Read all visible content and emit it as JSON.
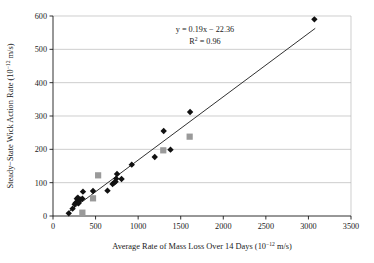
{
  "chart_data": {
    "type": "scatter",
    "title": "",
    "xlabel": "Average Rate of Mass Loss Over 14 Days (10−12 m/s)",
    "xlabel_base": "Average Rate of Mass Loss Over 14 Days (10",
    "xlabel_exp": "−12",
    "xlabel_tail": " m/s)",
    "ylabel": "Steady−State Wick Action Rate (10−12 m/s)",
    "ylabel_base": "Steady−State Wick Action Rate (10",
    "ylabel_exp": "−12",
    "ylabel_tail": " m/s)",
    "xlim": [
      0,
      3500
    ],
    "ylim": [
      0,
      600
    ],
    "xticks": [
      0,
      500,
      1000,
      1500,
      2000,
      2500,
      3000,
      3500
    ],
    "xticklabels": [
      "0",
      "500",
      "1000",
      "1500",
      "2000",
      "2500",
      "3000",
      "3500"
    ],
    "yticks": [
      0,
      100,
      200,
      300,
      400,
      500,
      600
    ],
    "yticklabels": [
      "0",
      "100",
      "200",
      "300",
      "400",
      "500",
      "600"
    ],
    "grid": "horizontal",
    "legend": "none",
    "annotations": {
      "equation": "y = 0.19x − 22.36",
      "r_squared_base": "R",
      "r_squared_exp": "2",
      "r_squared_value": " = 0.96",
      "r_squared": "R2 = 0.96"
    },
    "trendline": {
      "slope": 0.19,
      "intercept": -22.36,
      "r_squared": 0.96,
      "x_start": 170,
      "y_start": 10,
      "x_end": 3080,
      "y_end": 563,
      "color": "#1a1a1a"
    },
    "series": [
      {
        "name": "primary-diamonds",
        "marker": "diamond",
        "color": "#111111",
        "points": [
          [
            185,
            8
          ],
          [
            230,
            22
          ],
          [
            255,
            35
          ],
          [
            268,
            40
          ],
          [
            280,
            52
          ],
          [
            292,
            55
          ],
          [
            300,
            38
          ],
          [
            305,
            45
          ],
          [
            318,
            50
          ],
          [
            345,
            52
          ],
          [
            352,
            73
          ],
          [
            470,
            75
          ],
          [
            640,
            76
          ],
          [
            700,
            96
          ],
          [
            718,
            100
          ],
          [
            735,
            103
          ],
          [
            742,
            112
          ],
          [
            752,
            126
          ],
          [
            805,
            111
          ],
          [
            925,
            154
          ],
          [
            1195,
            177
          ],
          [
            1300,
            255
          ],
          [
            1380,
            199
          ],
          [
            1610,
            312
          ],
          [
            3070,
            590
          ]
        ]
      },
      {
        "name": "secondary-squares",
        "marker": "square",
        "color": "#9a9a9a",
        "points": [
          [
            345,
            10
          ],
          [
            470,
            53
          ],
          [
            530,
            122
          ],
          [
            1295,
            197
          ],
          [
            1605,
            238
          ]
        ]
      }
    ]
  }
}
